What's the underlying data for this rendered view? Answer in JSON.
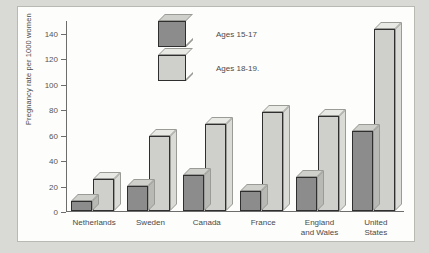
{
  "chart_data": {
    "type": "bar",
    "title": "",
    "xlabel": "",
    "ylabel": "Pregnancy rate per 1000 women",
    "ylim": [
      0,
      150
    ],
    "yticks": [
      0,
      20,
      40,
      60,
      80,
      100,
      120,
      140
    ],
    "grid": false,
    "legend_position": "top-center",
    "categories": [
      "Netherlands",
      "Sweden",
      "Canada",
      "France",
      "England\nand Wales",
      "United\nStates"
    ],
    "series": [
      {
        "name": "Ages 15-17",
        "color": "#8c8c8c",
        "values": [
          8,
          20,
          28,
          16,
          27,
          63
        ]
      },
      {
        "name": "Ages 18-19.",
        "color": "#cfcfcb",
        "values": [
          25,
          59,
          68,
          78,
          75,
          143
        ]
      }
    ]
  },
  "axis": {
    "y_title": "Pregnancy rate per 1000 women",
    "tick_labels": [
      "140",
      "120",
      "100",
      "80",
      "60",
      "40",
      "20",
      "0"
    ]
  },
  "legend": {
    "items": [
      {
        "label": "Ages 15-17"
      },
      {
        "label": "Ages 18-19."
      }
    ]
  }
}
